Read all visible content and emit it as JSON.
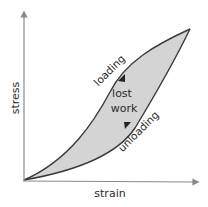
{
  "diagram": {
    "x_axis_label": "strain",
    "y_axis_label": "stress",
    "loading_label": "loading",
    "unloading_label": "unloading",
    "area_label_line1": "lost",
    "area_label_line2": "work",
    "colors": {
      "axis": "#8a8a8a",
      "curve": "#3a3a3a",
      "fill": "#d4d4d4",
      "text": "#2a2a2a"
    }
  }
}
